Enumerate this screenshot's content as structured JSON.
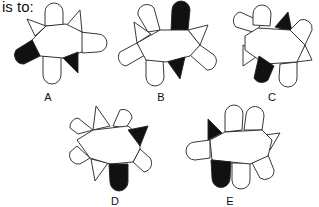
{
  "prompt": "is to:",
  "options": [
    {
      "label": "A",
      "label_pos": [
        38,
        91
      ]
    },
    {
      "label": "B",
      "label_pos": [
        151,
        91
      ]
    },
    {
      "label": "C",
      "label_pos": [
        262,
        91
      ]
    },
    {
      "label": "D",
      "label_pos": [
        105,
        195
      ]
    },
    {
      "label": "E",
      "label_pos": [
        220,
        195
      ]
    }
  ],
  "colors": {
    "stroke": "#222222",
    "fill_dark": "#111111",
    "fill_light": "#ffffff"
  }
}
